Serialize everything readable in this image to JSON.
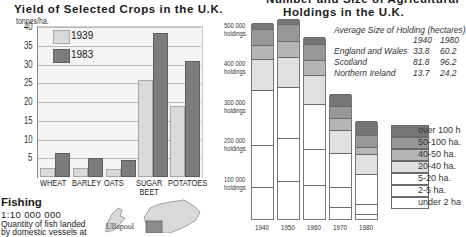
{
  "crops": {
    "title": "Yield of Selected Crops in the U.K.",
    "unit": "tonnes/ha.",
    "legend": [
      "1939",
      "1983"
    ]
  },
  "holdings": {
    "title_line1": "Number and Size of Agricultural",
    "title_line2": "Holdings in the U.K.",
    "y_ticks": [
      {
        "value": "500 000",
        "unit": "holdings"
      },
      {
        "value": "400 000",
        "unit": "holdings"
      },
      {
        "value": "300 000",
        "unit": "holdings"
      },
      {
        "value": "200 000",
        "unit": "holdings"
      },
      {
        "value": "100 000",
        "unit": "holdings"
      }
    ],
    "avg_table": {
      "heading": "Average Size of Holding (hectares)",
      "col1": "1940",
      "col2": "1980",
      "rows": [
        {
          "region": "England and Wales",
          "v1940": "33.8",
          "v1980": "60.2"
        },
        {
          "region": "Scotland",
          "v1940": "81.8",
          "v1980": "96.2"
        },
        {
          "region": "Northern Ireland",
          "v1940": "13.7",
          "v1980": "24.2"
        }
      ]
    },
    "legend": [
      "over 100 h",
      "50-100 ha.",
      "40-50 ha.",
      "20-40 ha.",
      "5-20 ha.",
      "2-5 ha.",
      "under 2 ha"
    ]
  },
  "fishing": {
    "title": "Fishing",
    "scale": "1:10 000 000",
    "desc_line1": "Quantity of fish landed",
    "desc_line2": "by domestic vessels at",
    "map_label": "Ullapool"
  },
  "chart_data": [
    {
      "type": "bar",
      "title": "Yield of Selected Crops in the U.K.",
      "xlabel": "",
      "ylabel": "tonnes/ha.",
      "ylim": [
        0,
        40
      ],
      "yticks": [
        5,
        10,
        15,
        20,
        25,
        30,
        35,
        40
      ],
      "grid": true,
      "legend_position": "upper-left",
      "categories": [
        "WHEAT",
        "BARLEY",
        "OATS",
        "SUGAR BEET",
        "POTATOES"
      ],
      "series": [
        {
          "name": "1939",
          "color": "#d9d9d9",
          "values": [
            2.3,
            2.5,
            2.2,
            26,
            19
          ]
        },
        {
          "name": "1983",
          "color": "#7c7c7c",
          "values": [
            6.5,
            5.0,
            4.5,
            38.5,
            31
          ]
        }
      ]
    },
    {
      "type": "bar",
      "stacked": true,
      "title": "Number and Size of Agricultural Holdings in the U.K.",
      "xlabel": "",
      "ylabel": "holdings",
      "ylim": [
        0,
        520000
      ],
      "yticks": [
        100000,
        200000,
        300000,
        400000,
        500000
      ],
      "legend_position": "right",
      "categories": [
        "1940",
        "1950",
        "1960",
        "1970",
        "1980"
      ],
      "series": [
        {
          "name": "under 2 ha",
          "color": "#ffffff",
          "values": [
            83000,
            99000,
            88000,
            31000,
            13000
          ]
        },
        {
          "name": "2-5 ha.",
          "color": "#ffffff",
          "values": [
            109000,
            111000,
            94000,
            52000,
            26000
          ]
        },
        {
          "name": "5-20 ha.",
          "color": "#ffffff",
          "values": [
            143000,
            133000,
            117000,
            88000,
            78000
          ]
        },
        {
          "name": "20-40 ha.",
          "color": "#e0e0e0",
          "values": [
            81000,
            78000,
            75000,
            60000,
            52000
          ]
        },
        {
          "name": "40-50 ha.",
          "color": "#b5b5b5",
          "values": [
            36000,
            41000,
            39000,
            31000,
            18000
          ]
        },
        {
          "name": "50-100 ha.",
          "color": "#979797",
          "values": [
            42000,
            44000,
            42000,
            32000,
            31000
          ]
        },
        {
          "name": "over 100 h",
          "color": "#767676",
          "values": [
            15000,
            13000,
            18000,
            31000,
            37000
          ]
        }
      ],
      "totals": [
        509000,
        519000,
        473000,
        325000,
        255000
      ]
    }
  ]
}
